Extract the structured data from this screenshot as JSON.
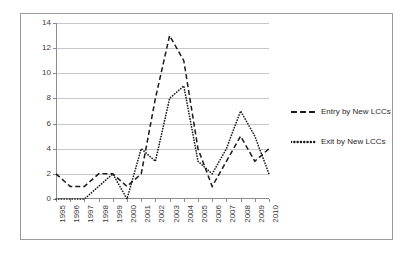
{
  "chart_data": {
    "type": "line",
    "title": "",
    "xlabel": "",
    "ylabel": "",
    "categories": [
      "1995",
      "1996",
      "1997",
      "1998",
      "1999",
      "2000",
      "2001",
      "2002",
      "2003",
      "2004",
      "2005",
      "2006",
      "2007",
      "2008",
      "2009",
      "2010"
    ],
    "series": [
      {
        "name": "Entry by New  LCCs",
        "style": "dashed",
        "color": "#1a1a1a",
        "values": [
          2,
          1,
          1,
          2,
          2,
          1,
          2,
          8,
          13,
          11,
          4,
          1,
          3,
          5,
          3,
          4
        ]
      },
      {
        "name": "Exit by New LCCs",
        "style": "dotted",
        "color": "#1a1a1a",
        "values": [
          0,
          0,
          0,
          1,
          2,
          0,
          4,
          3,
          8,
          9,
          3,
          2,
          4,
          7,
          5,
          2
        ]
      }
    ],
    "ylim": [
      0,
      14
    ],
    "yticks": [
      0,
      2,
      4,
      6,
      8,
      10,
      12,
      14
    ],
    "ytick_labels": [
      "0",
      "2",
      "4",
      "6",
      "8",
      "10",
      "12",
      "14"
    ],
    "grid": "horizontal",
    "legend_position": "right",
    "xtick_rotation": 90
  },
  "legend": {
    "items": [
      {
        "label": "Entry by New  LCCs",
        "style": "dashed"
      },
      {
        "label": "Exit by New LCCs",
        "style": "dotted"
      }
    ]
  },
  "colors": {
    "border": "#9a9a9a",
    "gridline": "#c8c8c8",
    "axis": "#8d8d8d",
    "text": "#2b2b2b",
    "series": "#1a1a1a"
  }
}
